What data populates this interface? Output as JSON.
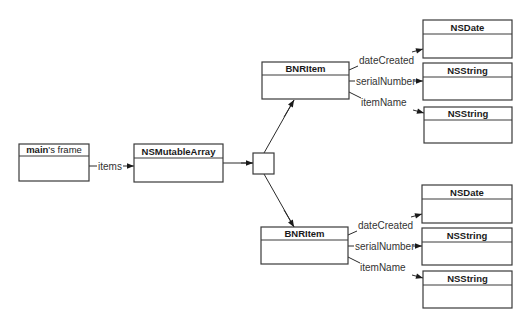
{
  "diagram": {
    "colors": {
      "stroke": "#3a3a3a",
      "text": "#1a1a1a",
      "label": "#333333",
      "background": "#ffffff"
    },
    "nodes": [
      {
        "id": "mainFrame",
        "title_bold": "main",
        "title_rest": "'s frame",
        "x": 19,
        "y": 144,
        "w": 70,
        "h": 37,
        "header_h": 12
      },
      {
        "id": "array",
        "title_bold": "NSMutableArray",
        "title_rest": "",
        "x": 134,
        "y": 144,
        "w": 89,
        "h": 38,
        "header_h": 14
      },
      {
        "id": "slot",
        "title_bold": "",
        "title_rest": "",
        "x": 253,
        "y": 153,
        "w": 21,
        "h": 21,
        "header_h": 0
      },
      {
        "id": "item1",
        "title_bold": "BNRItem",
        "title_rest": "",
        "x": 262,
        "y": 62,
        "w": 87,
        "h": 37,
        "header_h": 13
      },
      {
        "id": "item1Date",
        "title_bold": "NSDate",
        "title_rest": "",
        "x": 423,
        "y": 20,
        "w": 89,
        "h": 38,
        "header_h": 14
      },
      {
        "id": "item1Serial",
        "title_bold": "NSString",
        "title_rest": "",
        "x": 423,
        "y": 63,
        "w": 89,
        "h": 37,
        "header_h": 14
      },
      {
        "id": "item1Name",
        "title_bold": "NSString",
        "title_rest": "",
        "x": 424,
        "y": 107,
        "w": 88,
        "h": 36,
        "header_h": 13
      },
      {
        "id": "item2",
        "title_bold": "BNRItem",
        "title_rest": "",
        "x": 261,
        "y": 227,
        "w": 87,
        "h": 37,
        "header_h": 13
      },
      {
        "id": "item2Date",
        "title_bold": "NSDate",
        "title_rest": "",
        "x": 422,
        "y": 185,
        "w": 90,
        "h": 38,
        "header_h": 14
      },
      {
        "id": "item2Serial",
        "title_bold": "NSString",
        "title_rest": "",
        "x": 422,
        "y": 228,
        "w": 90,
        "h": 37,
        "header_h": 14
      },
      {
        "id": "item2Name",
        "title_bold": "NSString",
        "title_rest": "",
        "x": 423,
        "y": 271,
        "w": 89,
        "h": 37,
        "header_h": 14
      }
    ],
    "edges": [
      {
        "id": "items",
        "label": "items",
        "points": [
          [
            89,
            166
          ],
          [
            97,
            166
          ]
        ],
        "label_x": 98,
        "label_y": 169.5,
        "arrow_from": [
          123,
          166
        ],
        "arrow_to": [
          134,
          166
        ]
      },
      {
        "id": "array-to-slot",
        "label": "",
        "points": [
          [
            223,
            163
          ],
          [
            253,
            163
          ]
        ],
        "arrow_from": [
          241,
          163
        ],
        "arrow_to": [
          253,
          163
        ]
      },
      {
        "id": "slot-to-item1",
        "label": "",
        "points": [
          [
            264,
            153
          ],
          [
            294,
            100
          ]
        ],
        "arrow_from": [
          284,
          117
        ],
        "arrow_to": [
          294,
          100
        ]
      },
      {
        "id": "slot-to-item2",
        "label": "",
        "points": [
          [
            264,
            174
          ],
          [
            294,
            227
          ]
        ],
        "arrow_from": [
          284,
          210
        ],
        "arrow_to": [
          294,
          227
        ]
      },
      {
        "id": "item1-dateCreated",
        "label": "dateCreated",
        "points": [
          [
            349,
            70
          ],
          [
            358,
            66
          ]
        ],
        "label_x": 359,
        "label_y": 64,
        "arrow_from": [
          412,
          52
        ],
        "arrow_to": [
          423,
          49
        ]
      },
      {
        "id": "item1-serialNumber",
        "label": "serialNumber",
        "points": [
          [
            349,
            81
          ],
          [
            355,
            81
          ]
        ],
        "label_x": 356,
        "label_y": 84.5,
        "arrow_from": [
          414,
          81
        ],
        "arrow_to": [
          423,
          81
        ]
      },
      {
        "id": "item1-itemName",
        "label": "itemName",
        "points": [
          [
            349,
            92
          ],
          [
            361,
            98
          ]
        ],
        "label_x": 361,
        "label_y": 106,
        "arrow_from": [
          413,
          110
        ],
        "arrow_to": [
          424,
          113
        ]
      },
      {
        "id": "item2-dateCreated",
        "label": "dateCreated",
        "points": [
          [
            348,
            235
          ],
          [
            357,
            231
          ]
        ],
        "label_x": 358,
        "label_y": 229,
        "arrow_from": [
          411,
          217
        ],
        "arrow_to": [
          422,
          214
        ]
      },
      {
        "id": "item2-serialNumber",
        "label": "serialNumber",
        "points": [
          [
            348,
            246
          ],
          [
            354,
            246
          ]
        ],
        "label_x": 355,
        "label_y": 249.5,
        "arrow_from": [
          413,
          246
        ],
        "arrow_to": [
          422,
          246
        ]
      },
      {
        "id": "item2-itemName",
        "label": "itemName",
        "points": [
          [
            348,
            257
          ],
          [
            360,
            263
          ]
        ],
        "label_x": 360,
        "label_y": 271,
        "arrow_from": [
          412,
          275
        ],
        "arrow_to": [
          423,
          278
        ]
      }
    ]
  }
}
